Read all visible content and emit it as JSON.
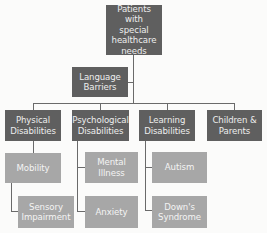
{
  "diagram": {
    "type": "hierarchy",
    "colors": {
      "primary_box": "#5f5f5f",
      "secondary_box": "#a7a7a7",
      "text": "#eeeeee",
      "connector": "#6a6a6a",
      "background": "#fbfbfa"
    },
    "root": {
      "label": "Patients with\nspecial\nhealthcare\nneeds"
    },
    "side_node": {
      "label": "Language\nBarriers"
    },
    "categories": [
      {
        "label": "Physical\nDisabilities",
        "children": [
          {
            "label": "Mobility"
          },
          {
            "label": "Sensory\nImpairment"
          }
        ]
      },
      {
        "label": "Psychological\nDisabilities",
        "children": [
          {
            "label": "Mental Illness"
          },
          {
            "label": "Anxiety"
          }
        ]
      },
      {
        "label": "Learning\nDisabilities",
        "children": [
          {
            "label": "Autism"
          },
          {
            "label": "Down's\nSyndrome"
          }
        ]
      },
      {
        "label": "Children &\nParents",
        "children": []
      }
    ]
  }
}
